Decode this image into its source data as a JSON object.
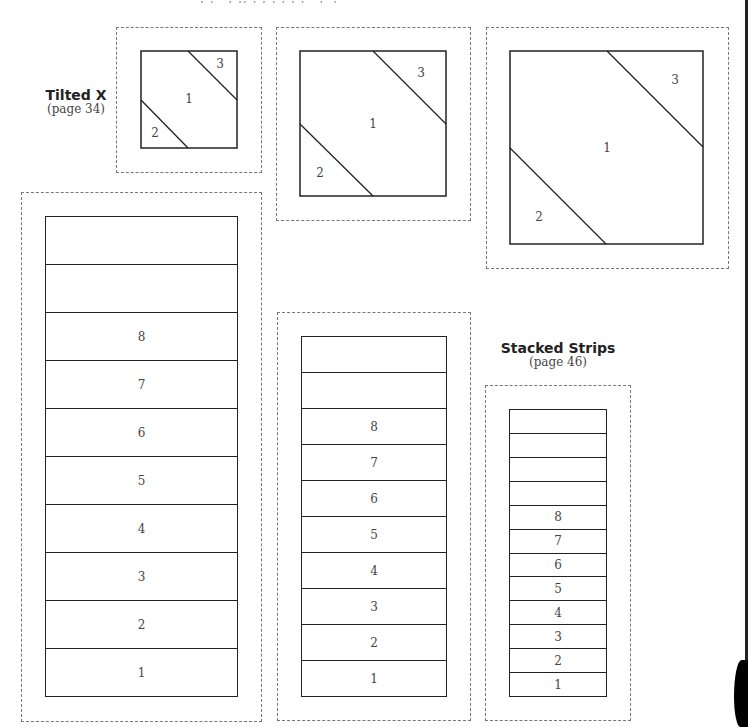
{
  "header": {
    "cropped_text": ", ‚ ' , ‚‚ , , ‚ ‚ , , ' ,' ,"
  },
  "tilted_x": {
    "title": "Tilted X",
    "page_ref": "(page 34)",
    "blocks": [
      {
        "size": "small",
        "patches": [
          "1",
          "2",
          "3"
        ]
      },
      {
        "size": "medium",
        "patches": [
          "1",
          "2",
          "3"
        ]
      },
      {
        "size": "large",
        "patches": [
          "1",
          "2",
          "3"
        ]
      }
    ]
  },
  "stacked_strips": {
    "title": "Stacked Strips",
    "page_ref": "(page 46)",
    "blocks": [
      {
        "size": "large",
        "strips": [
          "",
          "",
          "8",
          "7",
          "6",
          "5",
          "4",
          "3",
          "2",
          "1"
        ]
      },
      {
        "size": "medium",
        "strips": [
          "",
          "",
          "8",
          "7",
          "6",
          "5",
          "4",
          "3",
          "2",
          "1"
        ]
      },
      {
        "size": "small",
        "strips": [
          "",
          "",
          "",
          "",
          "8",
          "7",
          "6",
          "5",
          "4",
          "3",
          "2",
          "1"
        ]
      }
    ]
  },
  "colors": {
    "line": "#222222",
    "dashed": "#777777",
    "text": "#444444"
  }
}
